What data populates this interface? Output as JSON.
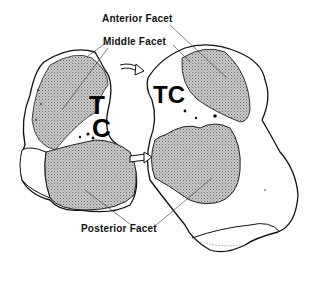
{
  "figure": {
    "labels": {
      "anterior_facet": "Anterior Facet",
      "middle_facet": "Middle Facet",
      "posterior_facet": "Posterior Facet"
    },
    "left_bone": {
      "letters": [
        "T",
        "C"
      ]
    },
    "right_bone": {
      "label": "TC"
    },
    "colors": {
      "outline": "#111111",
      "facet_fill": "#b8b8b8",
      "background": "#ffffff"
    }
  }
}
